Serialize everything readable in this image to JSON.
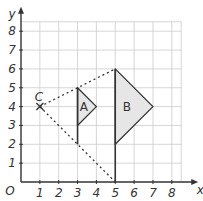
{
  "diagram": {
    "type": "enlargement-on-grid",
    "origin_label": "O",
    "x_axis_label": "x",
    "y_axis_label": "y",
    "x_ticks": [
      "1",
      "2",
      "3",
      "4",
      "5",
      "6",
      "7",
      "8"
    ],
    "y_ticks": [
      "1",
      "2",
      "3",
      "4",
      "5",
      "6",
      "7",
      "8"
    ],
    "grid_range": {
      "x": [
        0,
        8.5
      ],
      "y": [
        0,
        8.5
      ]
    },
    "centre": {
      "label": "C",
      "x": 1,
      "y": 4,
      "marker": "cross"
    },
    "shapes": [
      {
        "label": "A",
        "vertices": [
          [
            3,
            5
          ],
          [
            3,
            3
          ],
          [
            4,
            4
          ]
        ],
        "extra_line": [
          [
            3,
            5
          ],
          [
            3,
            2
          ]
        ],
        "fill": "#e6e6e6"
      },
      {
        "label": "B",
        "vertices": [
          [
            5,
            6
          ],
          [
            5,
            2
          ],
          [
            7,
            4
          ]
        ],
        "extra_line": [
          [
            5,
            6
          ],
          [
            5,
            0
          ]
        ],
        "fill": "#e6e6e6"
      }
    ],
    "rays": [
      {
        "from": [
          1,
          4
        ],
        "to": [
          5,
          6
        ],
        "style": "dotted"
      },
      {
        "from": [
          1,
          4
        ],
        "to": [
          5,
          0
        ],
        "style": "dotted"
      }
    ],
    "colors": {
      "grid": "#cccccc",
      "axis": "#333333",
      "line": "#333333",
      "fill": "#e6e6e6"
    }
  }
}
